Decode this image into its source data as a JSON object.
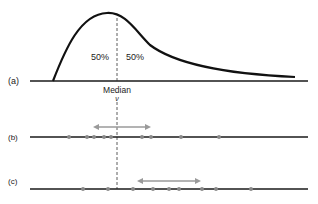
{
  "panels": {
    "a": {
      "label": "(a)",
      "left_pct": "50%",
      "right_pct": "50%",
      "median_label": "Median",
      "median_symbol": "ν"
    },
    "b": {
      "label": "(b)",
      "dots_x": [
        69,
        87,
        94,
        104,
        111,
        142,
        151,
        181,
        219
      ],
      "arrow": {
        "x1": 93,
        "x2": 151
      }
    },
    "c": {
      "label": "(c)",
      "dots_x": [
        83,
        108,
        133,
        153,
        169,
        179,
        202,
        216,
        251
      ],
      "arrow": {
        "x1": 137,
        "x2": 201
      }
    }
  },
  "colors": {
    "line": "#1a1a1a",
    "dot": "#8a8a8a",
    "arrow": "#9a9a9a",
    "dash": "#333333"
  }
}
